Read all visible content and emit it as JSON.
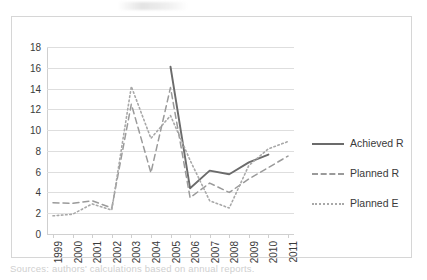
{
  "caption": "Sources: authors' calculations based on annual reports.",
  "chart_data": {
    "type": "line",
    "title": "",
    "xlabel": "",
    "ylabel": "",
    "ylim": [
      0,
      18
    ],
    "ytick_step": 2,
    "yticks": [
      0,
      2,
      4,
      6,
      8,
      10,
      12,
      14,
      16,
      18
    ],
    "grid": true,
    "legend_position": "right",
    "categories": [
      "1999",
      "2000",
      "2001",
      "2002",
      "2003",
      "2004",
      "2005",
      "2006",
      "2007",
      "2008",
      "2009",
      "2010",
      "2011"
    ],
    "series": [
      {
        "name": "Achieved R",
        "style": "solid",
        "color": "#6b6b6b",
        "values": [
          null,
          null,
          null,
          null,
          null,
          null,
          16.1,
          4.4,
          6.1,
          5.75,
          6.9,
          7.65,
          null
        ]
      },
      {
        "name": "Planned R",
        "style": "dashed",
        "color": "#9a9a9a",
        "values": [
          3.0,
          2.95,
          3.2,
          2.5,
          12.5,
          5.9,
          14.1,
          3.5,
          4.9,
          4.0,
          5.3,
          6.4,
          7.5
        ]
      },
      {
        "name": "Planned E",
        "style": "dotted",
        "color": "#a8a8a8",
        "values": [
          1.75,
          1.9,
          2.9,
          2.3,
          14.2,
          9.2,
          11.4,
          7.1,
          3.2,
          2.5,
          6.6,
          8.2,
          8.9
        ]
      }
    ]
  },
  "legend": {
    "items": [
      {
        "label": "Achieved R"
      },
      {
        "label": "Planned R"
      },
      {
        "label": "Planned E"
      }
    ]
  }
}
